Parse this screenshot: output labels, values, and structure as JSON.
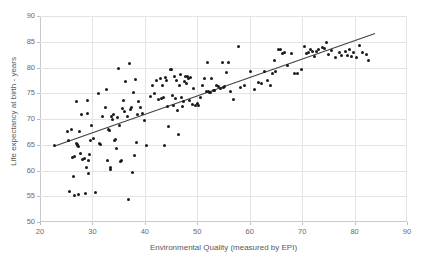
{
  "chart_data": {
    "type": "scatter",
    "title": "",
    "xlabel": "Environmental Quality (measured by EPI)",
    "ylabel": "Life expectancy at birth - years",
    "xlim": [
      20,
      90
    ],
    "ylim": [
      50,
      90
    ],
    "xticks": [
      20,
      30,
      40,
      50,
      60,
      70,
      80,
      90
    ],
    "yticks": [
      50,
      55,
      60,
      65,
      70,
      75,
      80,
      85,
      90
    ],
    "grid": true,
    "legend": "none",
    "marker_color": "#1a1a1a",
    "trendline_color": "#404040",
    "gridline_color": "#e4e4e4",
    "axis_color": "#c9c9c9",
    "text_color": "#595959",
    "trendline": {
      "type": "linear",
      "x_start": 22.7,
      "y_start": 64.7,
      "x_end": 83.9,
      "y_end": 86.6
    },
    "points": [
      [
        22.8,
        64.8
      ],
      [
        25.2,
        67.6
      ],
      [
        25.4,
        65.9
      ],
      [
        25.6,
        55.9
      ],
      [
        26.0,
        67.9
      ],
      [
        26.2,
        62.6
      ],
      [
        26.4,
        58.8
      ],
      [
        26.5,
        62.8
      ],
      [
        26.6,
        55.2
      ],
      [
        26.9,
        73.4
      ],
      [
        27.0,
        65.2
      ],
      [
        27.1,
        64.9
      ],
      [
        27.2,
        65.1
      ],
      [
        27.3,
        55.3
      ],
      [
        27.4,
        64.7
      ],
      [
        27.6,
        67.5
      ],
      [
        27.8,
        63.3
      ],
      [
        27.9,
        70.8
      ],
      [
        28.2,
        62.1
      ],
      [
        28.4,
        62.4
      ],
      [
        28.6,
        55.6
      ],
      [
        28.8,
        60.6
      ],
      [
        29.0,
        71.0
      ],
      [
        29.1,
        73.5
      ],
      [
        29.2,
        62.0
      ],
      [
        29.3,
        59.5
      ],
      [
        29.5,
        63.2
      ],
      [
        29.7,
        65.9
      ],
      [
        29.9,
        68.8
      ],
      [
        30.2,
        66.3
      ],
      [
        30.6,
        55.7
      ],
      [
        31.2,
        75.0
      ],
      [
        31.4,
        65.3
      ],
      [
        31.6,
        65.1
      ],
      [
        32.0,
        70.4
      ],
      [
        32.4,
        72.3
      ],
      [
        32.6,
        75.8
      ],
      [
        32.9,
        62.0
      ],
      [
        33.1,
        68.0
      ],
      [
        33.2,
        67.8
      ],
      [
        33.4,
        60.2
      ],
      [
        33.5,
        60.5
      ],
      [
        33.6,
        70.5
      ],
      [
        33.8,
        69.9
      ],
      [
        34.0,
        70.8
      ],
      [
        34.2,
        65.9
      ],
      [
        34.4,
        66.1
      ],
      [
        34.6,
        64.3
      ],
      [
        34.8,
        70.2
      ],
      [
        35.0,
        79.8
      ],
      [
        35.2,
        68.8
      ],
      [
        35.4,
        61.8
      ],
      [
        35.6,
        62.0
      ],
      [
        35.8,
        72.0
      ],
      [
        36.0,
        73.6
      ],
      [
        36.2,
        71.5
      ],
      [
        36.4,
        77.3
      ],
      [
        36.6,
        70.4
      ],
      [
        36.8,
        54.4
      ],
      [
        37.0,
        80.7
      ],
      [
        37.2,
        71.8
      ],
      [
        37.4,
        72.2
      ],
      [
        37.6,
        59.7
      ],
      [
        37.8,
        75.2
      ],
      [
        38.0,
        62.9
      ],
      [
        38.2,
        77.7
      ],
      [
        38.4,
        65.5
      ],
      [
        38.6,
        70.9
      ],
      [
        38.8,
        73.4
      ],
      [
        39.2,
        72.3
      ],
      [
        39.6,
        71.1
      ],
      [
        40.0,
        69.8
      ],
      [
        40.4,
        64.8
      ],
      [
        41.0,
        74.4
      ],
      [
        41.4,
        76.5
      ],
      [
        41.8,
        74.9
      ],
      [
        42.2,
        77.5
      ],
      [
        42.6,
        73.8
      ],
      [
        43.0,
        77.9
      ],
      [
        43.2,
        74.0
      ],
      [
        43.4,
        76.6
      ],
      [
        43.6,
        74.2
      ],
      [
        43.8,
        64.9
      ],
      [
        44.0,
        78.1
      ],
      [
        44.2,
        77.4
      ],
      [
        44.4,
        72.4
      ],
      [
        44.6,
        68.6
      ],
      [
        44.8,
        79.6
      ],
      [
        45.0,
        79.7
      ],
      [
        45.2,
        74.5
      ],
      [
        45.4,
        72.6
      ],
      [
        45.6,
        78.2
      ],
      [
        45.8,
        73.9
      ],
      [
        46.0,
        77.5
      ],
      [
        46.2,
        71.6
      ],
      [
        46.4,
        67.0
      ],
      [
        46.6,
        76.6
      ],
      [
        46.8,
        78.7
      ],
      [
        47.0,
        74.2
      ],
      [
        47.2,
        72.5
      ],
      [
        47.4,
        73.4
      ],
      [
        47.6,
        77.2
      ],
      [
        47.8,
        78.3
      ],
      [
        48.0,
        76.8
      ],
      [
        48.2,
        78.2
      ],
      [
        48.4,
        77.9
      ],
      [
        48.6,
        73.6
      ],
      [
        48.8,
        78.0
      ],
      [
        49.0,
        72.9
      ],
      [
        49.2,
        76.0
      ],
      [
        49.6,
        72.6
      ],
      [
        50.0,
        73.0
      ],
      [
        50.2,
        72.7
      ],
      [
        50.6,
        74.2
      ],
      [
        51.0,
        76.5
      ],
      [
        51.4,
        77.8
      ],
      [
        51.8,
        75.4
      ],
      [
        52.0,
        80.9
      ],
      [
        52.2,
        75.3
      ],
      [
        52.4,
        75.1
      ],
      [
        52.6,
        75.2
      ],
      [
        52.8,
        77.9
      ],
      [
        53.0,
        75.6
      ],
      [
        53.2,
        75.5
      ],
      [
        53.6,
        76.6
      ],
      [
        54.0,
        76.3
      ],
      [
        54.4,
        75.9
      ],
      [
        54.8,
        81.0
      ],
      [
        55.0,
        76.2
      ],
      [
        55.2,
        76.4
      ],
      [
        55.6,
        79.0
      ],
      [
        56.0,
        80.9
      ],
      [
        56.4,
        75.4
      ],
      [
        57.0,
        73.8
      ],
      [
        57.8,
        84.0
      ],
      [
        58.2,
        76.2
      ],
      [
        59.0,
        76.5
      ],
      [
        60.2,
        79.2
      ],
      [
        61.0,
        75.7
      ],
      [
        61.6,
        77.0
      ],
      [
        62.2,
        76.9
      ],
      [
        62.8,
        79.2
      ],
      [
        63.4,
        77.4
      ],
      [
        64.0,
        76.5
      ],
      [
        64.4,
        78.8
      ],
      [
        64.8,
        81.4
      ],
      [
        65.0,
        79.2
      ],
      [
        65.4,
        83.5
      ],
      [
        65.8,
        83.4
      ],
      [
        66.2,
        82.7
      ],
      [
        66.6,
        82.9
      ],
      [
        67.2,
        80.3
      ],
      [
        68.0,
        82.7
      ],
      [
        68.6,
        78.9
      ],
      [
        69.2,
        78.8
      ],
      [
        69.8,
        79.7
      ],
      [
        70.4,
        84.0
      ],
      [
        70.8,
        82.8
      ],
      [
        71.2,
        82.9
      ],
      [
        71.6,
        83.5
      ],
      [
        72.0,
        83.2
      ],
      [
        72.4,
        82.2
      ],
      [
        72.8,
        83.1
      ],
      [
        73.2,
        83.4
      ],
      [
        73.8,
        83.8
      ],
      [
        74.2,
        83.7
      ],
      [
        74.6,
        84.9
      ],
      [
        75.0,
        82.6
      ],
      [
        75.6,
        83.3
      ],
      [
        76.4,
        81.9
      ],
      [
        77.2,
        82.9
      ],
      [
        77.6,
        82.4
      ],
      [
        78.2,
        83.2
      ],
      [
        78.6,
        82.4
      ],
      [
        79.0,
        83.4
      ],
      [
        79.4,
        82.2
      ],
      [
        79.8,
        83.0
      ],
      [
        80.4,
        81.9
      ],
      [
        81.0,
        84.2
      ],
      [
        81.6,
        82.9
      ],
      [
        82.2,
        82.6
      ],
      [
        82.6,
        81.4
      ]
    ]
  },
  "axes": {
    "y_tick_labels": [
      "90",
      "85",
      "80",
      "75",
      "70",
      "65",
      "60",
      "55",
      "50"
    ],
    "x_tick_labels": [
      "20",
      "30",
      "40",
      "50",
      "60",
      "70",
      "80",
      "90"
    ],
    "x_axis_title": "Environmental Quality (measured by EPI)",
    "y_axis_title": "Life expectancy at birth - years"
  }
}
